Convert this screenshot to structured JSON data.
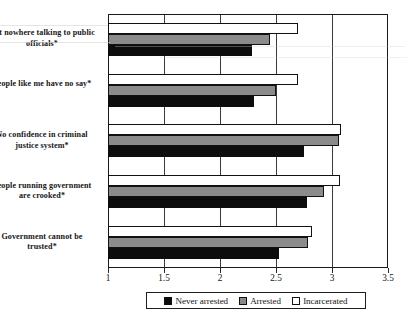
{
  "chart_data": {
    "type": "bar",
    "orientation": "horizontal",
    "title": "",
    "xlabel": "",
    "ylabel": "",
    "xlim": [
      1,
      3.5
    ],
    "xticks": [
      "1",
      "1.5",
      "2",
      "2.5",
      "3",
      "3.5"
    ],
    "xtick_values": [
      1,
      1.5,
      2,
      2.5,
      3,
      3.5
    ],
    "grid": true,
    "grid_axis": "x",
    "legend_position": "bottom",
    "categories": [
      "Get nowhere talking to public officials*",
      "People like me have no say*",
      "No confidence in criminal justice system*",
      "People running government are crooked*",
      "Government cannot be trusted*"
    ],
    "series": [
      {
        "name": "Never arrested",
        "color": "#0d0d0d",
        "values": [
          2.29,
          2.3,
          2.75,
          2.78,
          2.53
        ]
      },
      {
        "name": "Arrested",
        "color": "#8b8b8b",
        "values": [
          2.45,
          2.5,
          3.06,
          2.93,
          2.79
        ]
      },
      {
        "name": "Incarcerated",
        "color": "#ffffff",
        "values": [
          2.7,
          2.7,
          3.08,
          3.07,
          2.82
        ]
      }
    ]
  },
  "legend": {
    "items": [
      {
        "label": "Never arrested",
        "swatch": "never"
      },
      {
        "label": "Arrested",
        "swatch": "arrested"
      },
      {
        "label": "Incarcerated",
        "swatch": "incarcerated"
      }
    ]
  }
}
